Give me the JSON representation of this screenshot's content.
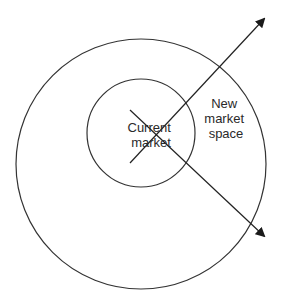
{
  "diagram": {
    "colors": {
      "stroke": "#333333",
      "background": "#ffffff"
    },
    "outer_circle": {
      "label": [
        "New",
        "market",
        "space"
      ]
    },
    "inner_circle": {
      "label": [
        "Current",
        "market"
      ]
    },
    "arrows": [
      {
        "name": "arrow-up-right",
        "direction": "up-right"
      },
      {
        "name": "arrow-down-right",
        "direction": "down-right"
      }
    ]
  }
}
